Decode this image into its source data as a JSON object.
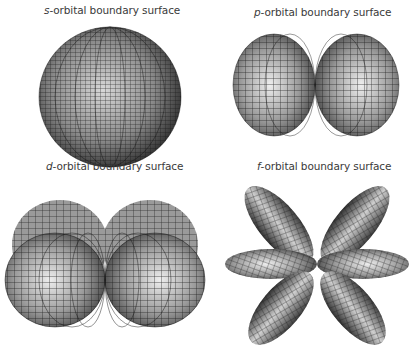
{
  "figure": {
    "panels": [
      {
        "id": "s",
        "letter": "s",
        "label_rest": "-orbital boundary surface",
        "shape": "sphere"
      },
      {
        "id": "p",
        "letter": "p",
        "label_rest": "-orbital boundary surface",
        "shape": "two lobes"
      },
      {
        "id": "d",
        "letter": "d",
        "label_rest": "-orbital boundary surface",
        "shape": "four lobes (two visible pairs)"
      },
      {
        "id": "f",
        "letter": "f",
        "label_rest": "-orbital boundary surface",
        "shape": "six lobes"
      }
    ]
  },
  "colors": {
    "background": "#ffffff",
    "surface_light": "#e8e8e8",
    "surface_dark": "#2a2a2a",
    "mesh": "#1a1a1a",
    "label": "#3a3a3a"
  }
}
